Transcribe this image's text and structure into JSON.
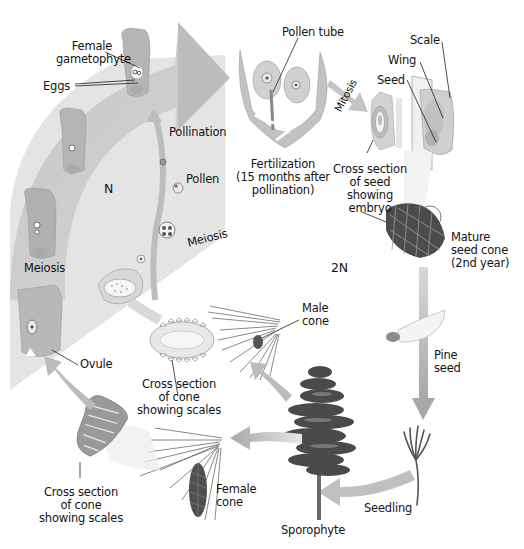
{
  "diagram": {
    "regions": {
      "haploid": "N",
      "diploid": "2N"
    },
    "labels": {
      "female_gametophyte": "Female\ngametophyte",
      "female_gametophyte_l1": "Female",
      "female_gametophyte_l2": "gametophyte",
      "eggs": "Eggs",
      "pollen_tube": "Pollen tube",
      "scale": "Scale",
      "wing": "Wing",
      "seed": "Seed",
      "mitosis": "Mitosis",
      "pollination": "Pollination",
      "pollen": "Pollen",
      "meiosis_right": "Meiosis",
      "meiosis_left": "Meiosis",
      "fertilization_l1": "Fertilization",
      "fertilization_l2": "(15 months after",
      "fertilization_l3": "pollination)",
      "cross_section_seed_l1": "Cross section",
      "cross_section_seed_l2": "of seed",
      "cross_section_seed_l3": "showing",
      "cross_section_seed_l4": "embryo",
      "mature_cone_l1": "Mature",
      "mature_cone_l2": "seed cone",
      "mature_cone_l3": "(2nd year)",
      "male_cone_l1": "Male",
      "male_cone_l2": "cone",
      "ovule": "Ovule",
      "cross_section_cone_male_l1": "Cross section",
      "cross_section_cone_male_l2": "of cone",
      "cross_section_cone_male_l3": "showing scales",
      "pine_seed_l1": "Pine",
      "pine_seed_l2": "seed",
      "cross_section_cone_female_l1": "Cross section",
      "cross_section_cone_female_l2": "of cone",
      "cross_section_cone_female_l3": "showing scales",
      "female_cone_l1": "Female",
      "female_cone_l2": "cone",
      "seedling": "Seedling",
      "sporophyte": "Sporophyte"
    },
    "colors": {
      "haploid_band": "#c9c9c9",
      "haploid_fill": "#e2e2e2",
      "arrow": "#b8b8b8",
      "tissue": "#cfcfcf",
      "dark_tissue": "#5a5a5a",
      "tree": "#4a4a4a"
    }
  }
}
